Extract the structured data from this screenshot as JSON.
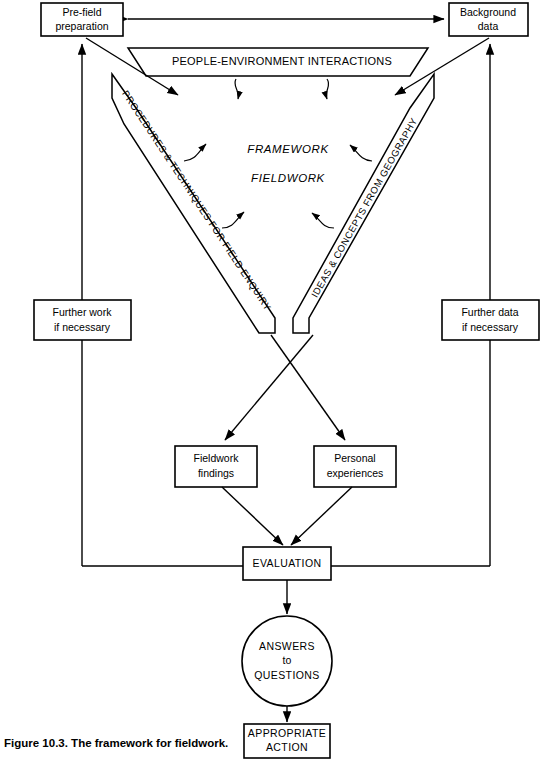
{
  "figure": {
    "caption": "Figure 10.3. The framework for fieldwork.",
    "title_text": "The framework for fieldwork"
  },
  "nodes": {
    "prefield": {
      "line1": "Pre-field",
      "line2": "preparation"
    },
    "background": {
      "line1": "Background",
      "line2": "data"
    },
    "banner": {
      "label": "PEOPLE-ENVIRONMENT INTERACTIONS"
    },
    "left_bar": {
      "label": "PROCEDURES & TECHNIQUES FOR FIELD ENQUIRY"
    },
    "right_bar": {
      "label": "IDEAS & CONCEPTS FROM GEOGRAPHY"
    },
    "center": {
      "line1": "FRAMEWORK",
      "line2": "FIELDWORK"
    },
    "further_work": {
      "line1": "Further work",
      "line2": "if necessary"
    },
    "further_data": {
      "line1": "Further data",
      "line2": "if necessary"
    },
    "fieldwork_findings": {
      "line1": "Fieldwork",
      "line2": "findings"
    },
    "personal_experiences": {
      "line1": "Personal",
      "line2": "experiences"
    },
    "evaluation": {
      "label": "EVALUATION"
    },
    "answers": {
      "line1": "ANSWERS",
      "line2": "to",
      "line3": "QUESTIONS"
    },
    "action": {
      "line1": "APPROPRIATE",
      "line2": "ACTION"
    }
  },
  "colors": {
    "stroke": "#000000",
    "fill": "#ffffff",
    "background": "#ffffff"
  }
}
